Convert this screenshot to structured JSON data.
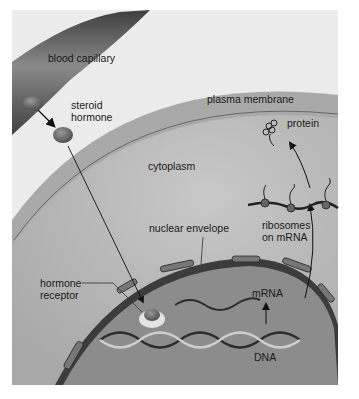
{
  "figure": {
    "labels": {
      "blood_capillary": "blood capillary",
      "steroid_hormone_line1": "steroid",
      "steroid_hormone_line2": "hormone",
      "plasma_membrane": "plasma membrane",
      "protein": "protein",
      "cytoplasm": "cytoplasm",
      "ribosomes_line1": "ribosomes",
      "ribosomes_line2": "on mRNA",
      "nuclear_envelope": "nuclear envelope",
      "hormone_receptor_line1": "hormone",
      "hormone_receptor_line2": "receptor",
      "mrna": "mRNA",
      "dna": "DNA"
    },
    "colors": {
      "background": "#e9e9e9",
      "cytoplasm": "#b8b8b8",
      "membrane_band": "#a6a6a6",
      "nucleus": "#8e8e8e",
      "envelope": "#4a4a4a",
      "capillary": "#5a5a5a",
      "hormone": "#6e6e6e"
    }
  }
}
